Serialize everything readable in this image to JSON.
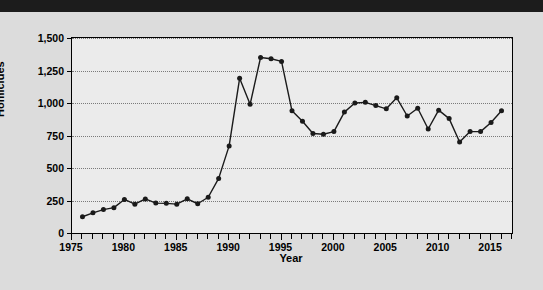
{
  "header": {
    "visible_text": ""
  },
  "chart_data": {
    "type": "line",
    "title": "",
    "xlabel": "Year",
    "ylabel": "Homicides",
    "xlim": [
      1975,
      2017
    ],
    "ylim": [
      0,
      1500
    ],
    "yticks": [
      0,
      250,
      500,
      750,
      1000,
      1250,
      1500
    ],
    "ytick_labels": [
      "0",
      "250",
      "500",
      "750",
      "1,000",
      "1,250",
      "1,500"
    ],
    "xticks": [
      1975,
      1980,
      1985,
      1990,
      1995,
      2000,
      2005,
      2010,
      2015
    ],
    "xtick_labels": [
      "1975",
      "1980",
      "1985",
      "1990",
      "1995",
      "2000",
      "2005",
      "2010",
      "2015"
    ],
    "grid": true,
    "grid_axis": "y",
    "legend": null,
    "marker": "circle",
    "line_color": "#1a1a1a",
    "marker_color": "#1a1a1a",
    "plot_background": "#ebebeb",
    "figure_background": "#dcdcdc",
    "x": [
      1976,
      1977,
      1978,
      1979,
      1980,
      1981,
      1982,
      1983,
      1984,
      1985,
      1986,
      1987,
      1988,
      1989,
      1990,
      1991,
      1992,
      1993,
      1994,
      1995,
      1996,
      1997,
      1998,
      1999,
      2000,
      2001,
      2002,
      2003,
      2004,
      2005,
      2006,
      2007,
      2008,
      2009,
      2010,
      2011,
      2012,
      2013,
      2014,
      2015,
      2016
    ],
    "values": [
      125,
      155,
      180,
      195,
      258,
      222,
      262,
      230,
      228,
      222,
      263,
      225,
      275,
      420,
      670,
      1190,
      990,
      1350,
      1340,
      1320,
      940,
      860,
      765,
      760,
      780,
      930,
      1000,
      1005,
      980,
      955,
      1040,
      900,
      960,
      800,
      945,
      880,
      700,
      780,
      780,
      850,
      940
    ]
  }
}
